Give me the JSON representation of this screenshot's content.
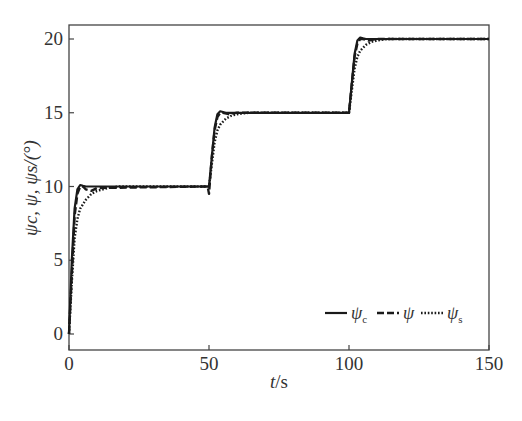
{
  "chart_data": {
    "type": "line",
    "title": "",
    "xlabel": "t/s",
    "ylabel": "ψc, ψ, ψs/(°)",
    "xlim": [
      0,
      150
    ],
    "ylim": [
      -0.5,
      21
    ],
    "xticks": [
      0,
      50,
      100,
      150
    ],
    "yticks": [
      0,
      5,
      10,
      15,
      20
    ],
    "grid": false,
    "legend_position": "lower right",
    "series": [
      {
        "name": "ψc",
        "style": "solid",
        "x": [
          0,
          1,
          2,
          3,
          4,
          5,
          6,
          8,
          49.5,
          50,
          51,
          52,
          53,
          54,
          55,
          56,
          58,
          99.5,
          100,
          101,
          102,
          103,
          104,
          105,
          106,
          108,
          150
        ],
        "y": [
          0,
          5,
          8.5,
          9.8,
          10.1,
          10.05,
          10,
          10,
          10,
          10,
          12,
          14,
          14.9,
          15.1,
          15.05,
          15,
          15,
          15,
          15,
          17,
          19,
          19.9,
          20.1,
          20.05,
          20,
          20,
          20
        ]
      },
      {
        "name": "ψ",
        "style": "dashed",
        "x": [
          0,
          1,
          2,
          3,
          4,
          5,
          6,
          8,
          10,
          49.5,
          50,
          51,
          52,
          53,
          54,
          55,
          57,
          60,
          99.5,
          100,
          101,
          102,
          103,
          104,
          105,
          107,
          110,
          150
        ],
        "y": [
          0,
          4,
          8,
          9.5,
          10,
          10,
          9.8,
          9.7,
          9.9,
          10,
          9.5,
          12,
          13.8,
          14.7,
          15,
          15,
          14.9,
          15,
          15,
          15,
          17,
          18.8,
          19.7,
          20,
          20,
          19.9,
          20,
          20
        ]
      },
      {
        "name": "ψs",
        "style": "dotted",
        "x": [
          0,
          1,
          2,
          3,
          4,
          6,
          8,
          10,
          14,
          18,
          50,
          51,
          52,
          53,
          54,
          56,
          58,
          60,
          64,
          68,
          100,
          101,
          102,
          103,
          104,
          106,
          108,
          110,
          114,
          118,
          150
        ],
        "y": [
          0,
          3.5,
          6.5,
          7.8,
          8.5,
          9.1,
          9.5,
          9.7,
          9.9,
          10,
          10,
          11.5,
          13,
          13.8,
          14.2,
          14.6,
          14.8,
          14.9,
          15,
          15,
          15,
          16.5,
          18,
          18.8,
          19.2,
          19.6,
          19.8,
          19.9,
          20,
          20,
          20
        ]
      }
    ]
  },
  "axes": {
    "xlabel_italic": "t",
    "xlabel_unit": "/s",
    "ylabel": "ψc, ψ, ψs/(°)"
  },
  "legend": {
    "items": [
      {
        "label": "ψ",
        "sub": "c",
        "style": "solid"
      },
      {
        "label": "ψ",
        "sub": "",
        "style": "dashed"
      },
      {
        "label": "ψ",
        "sub": "s",
        "style": "dotted"
      }
    ]
  },
  "colors": {
    "line": "#1a1a1a",
    "axis": "#444444"
  }
}
